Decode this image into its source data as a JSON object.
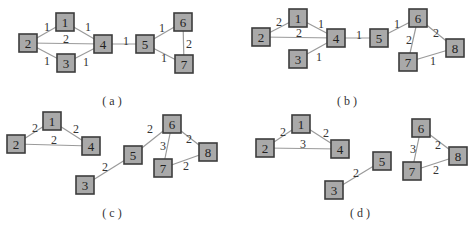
{
  "style": {
    "node_fill": "#a9a9a9",
    "node_stroke": "#3c3c3c",
    "edge_color": "#9a9a9a",
    "text_color": "#222222"
  },
  "panels": [
    {
      "id": "a",
      "caption": "( a )",
      "caption_pos": [
        112,
        101
      ],
      "nodes": [
        {
          "id": "1",
          "x": 65,
          "y": 22
        },
        {
          "id": "2",
          "x": 28,
          "y": 43
        },
        {
          "id": "3",
          "x": 66,
          "y": 63
        },
        {
          "id": "4",
          "x": 103,
          "y": 44
        },
        {
          "id": "5",
          "x": 145,
          "y": 44
        },
        {
          "id": "6",
          "x": 183,
          "y": 22
        },
        {
          "id": "7",
          "x": 184,
          "y": 64
        }
      ],
      "edges": [
        {
          "from": "2",
          "to": "1",
          "weight": "1",
          "lx": 47,
          "ly": 27
        },
        {
          "from": "1",
          "to": "4",
          "weight": "1",
          "lx": 88,
          "ly": 27
        },
        {
          "from": "2",
          "to": "4",
          "weight": "2",
          "lx": 66,
          "ly": 39
        },
        {
          "from": "2",
          "to": "3",
          "weight": "1",
          "lx": 47,
          "ly": 61
        },
        {
          "from": "3",
          "to": "4",
          "weight": "1",
          "lx": 86,
          "ly": 62
        },
        {
          "from": "4",
          "to": "5",
          "weight": "1",
          "lx": 126,
          "ly": 41
        },
        {
          "from": "5",
          "to": "6",
          "weight": "1",
          "lx": 162,
          "ly": 28
        },
        {
          "from": "5",
          "to": "7",
          "weight": "1",
          "lx": 164,
          "ly": 58
        },
        {
          "from": "6",
          "to": "7",
          "weight": "2",
          "lx": 189,
          "ly": 44
        }
      ]
    },
    {
      "id": "b",
      "caption": "( b )",
      "caption_pos": [
        347,
        101
      ],
      "nodes": [
        {
          "id": "1",
          "x": 298,
          "y": 18
        },
        {
          "id": "2",
          "x": 261,
          "y": 37
        },
        {
          "id": "3",
          "x": 298,
          "y": 59
        },
        {
          "id": "4",
          "x": 336,
          "y": 38
        },
        {
          "id": "5",
          "x": 379,
          "y": 38
        },
        {
          "id": "6",
          "x": 418,
          "y": 18
        },
        {
          "id": "7",
          "x": 408,
          "y": 62
        },
        {
          "id": "8",
          "x": 455,
          "y": 48
        }
      ],
      "edges": [
        {
          "from": "2",
          "to": "1",
          "weight": "2",
          "lx": 279,
          "ly": 22
        },
        {
          "from": "1",
          "to": "4",
          "weight": "1",
          "lx": 321,
          "ly": 24
        },
        {
          "from": "2",
          "to": "4",
          "weight": "2",
          "lx": 299,
          "ly": 33
        },
        {
          "from": "3",
          "to": "4",
          "weight": "1",
          "lx": 319,
          "ly": 57
        },
        {
          "from": "4",
          "to": "5",
          "weight": "1",
          "lx": 359,
          "ly": 35
        },
        {
          "from": "5",
          "to": "6",
          "weight": "1",
          "lx": 397,
          "ly": 24
        },
        {
          "from": "6",
          "to": "7",
          "weight": "2",
          "lx": 409,
          "ly": 40
        },
        {
          "from": "6",
          "to": "8",
          "weight": "2",
          "lx": 436,
          "ly": 33
        },
        {
          "from": "7",
          "to": "8",
          "weight": "1",
          "lx": 433,
          "ly": 61
        }
      ]
    },
    {
      "id": "c",
      "caption": "( c )",
      "caption_pos": [
        112,
        213
      ],
      "nodes": [
        {
          "id": "1",
          "x": 52,
          "y": 121
        },
        {
          "id": "2",
          "x": 16,
          "y": 144
        },
        {
          "id": "4",
          "x": 91,
          "y": 146
        },
        {
          "id": "3",
          "x": 85,
          "y": 185
        },
        {
          "id": "5",
          "x": 133,
          "y": 155
        },
        {
          "id": "6",
          "x": 172,
          "y": 124
        },
        {
          "id": "7",
          "x": 163,
          "y": 168
        },
        {
          "id": "8",
          "x": 208,
          "y": 152
        }
      ],
      "edges": [
        {
          "from": "2",
          "to": "1",
          "weight": "2",
          "lx": 35,
          "ly": 128
        },
        {
          "from": "1",
          "to": "4",
          "weight": "2",
          "lx": 76,
          "ly": 129
        },
        {
          "from": "2",
          "to": "4",
          "weight": "2",
          "lx": 54,
          "ly": 140
        },
        {
          "from": "3",
          "to": "5",
          "weight": "2",
          "lx": 105,
          "ly": 167
        },
        {
          "from": "5",
          "to": "6",
          "weight": "2",
          "lx": 150,
          "ly": 129
        },
        {
          "from": "6",
          "to": "7",
          "weight": "3",
          "lx": 163,
          "ly": 146
        },
        {
          "from": "6",
          "to": "8",
          "weight": "2",
          "lx": 189,
          "ly": 139
        },
        {
          "from": "7",
          "to": "8",
          "weight": "2",
          "lx": 186,
          "ly": 166
        }
      ]
    },
    {
      "id": "d",
      "caption": "( d )",
      "caption_pos": [
        360,
        213
      ],
      "nodes": [
        {
          "id": "1",
          "x": 301,
          "y": 124
        },
        {
          "id": "2",
          "x": 265,
          "y": 148
        },
        {
          "id": "4",
          "x": 340,
          "y": 149
        },
        {
          "id": "3",
          "x": 334,
          "y": 190
        },
        {
          "id": "5",
          "x": 382,
          "y": 161
        },
        {
          "id": "6",
          "x": 421,
          "y": 128
        },
        {
          "id": "7",
          "x": 412,
          "y": 171
        },
        {
          "id": "8",
          "x": 458,
          "y": 156
        }
      ],
      "edges": [
        {
          "from": "2",
          "to": "1",
          "weight": "2",
          "lx": 283,
          "ly": 132
        },
        {
          "from": "1",
          "to": "4",
          "weight": "2",
          "lx": 326,
          "ly": 133
        },
        {
          "from": "2",
          "to": "4",
          "weight": "3",
          "lx": 303,
          "ly": 144
        },
        {
          "from": "3",
          "to": "5",
          "weight": "2",
          "lx": 356,
          "ly": 173
        },
        {
          "from": "6",
          "to": "7",
          "weight": "3",
          "lx": 413,
          "ly": 149
        },
        {
          "from": "6",
          "to": "8",
          "weight": "2",
          "lx": 438,
          "ly": 145
        },
        {
          "from": "7",
          "to": "8",
          "weight": "2",
          "lx": 436,
          "ly": 170
        }
      ]
    }
  ]
}
